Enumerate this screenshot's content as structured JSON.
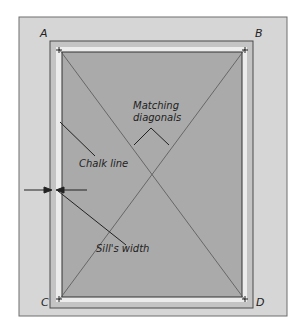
{
  "diagram": {
    "corner_labels": {
      "a": "A",
      "b": "B",
      "c": "C",
      "d": "D"
    },
    "callouts": {
      "matching_line1": "Matching",
      "matching_line2": "diagonals",
      "chalk_line": "Chalk line",
      "sills_width": "Sill's width"
    },
    "colors": {
      "panel": "#d6d6d6",
      "panel_border": "#6e6e6e",
      "sill_frame": "#c4c4c4",
      "sill_strip": "#ececec",
      "opening": "#aaaaaa",
      "lines": "#3a3a3a"
    }
  }
}
